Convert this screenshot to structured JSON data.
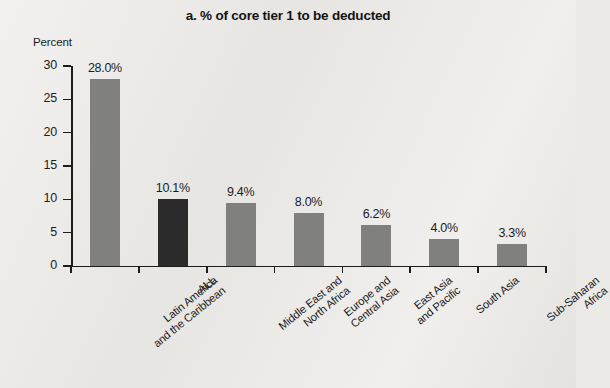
{
  "chart_data": {
    "type": "bar",
    "title": "a.  % of core tier 1 to be deducted",
    "xlabel": "",
    "ylabel": "Percent",
    "ylim": [
      0,
      30
    ],
    "yticks": [
      0,
      5,
      10,
      15,
      20,
      25,
      30
    ],
    "ytick_labels": [
      "0",
      "5",
      "10",
      "15",
      "20",
      "25",
      "30"
    ],
    "grid": false,
    "legend": "none",
    "categories": [
      "Latin America and the Caribbean",
      "ALL",
      "Middle East and North Africa",
      "Europe and Central Asia",
      "East Asia and Pacific",
      "South Asia",
      "Sub-Saharan Africa"
    ],
    "category_lines": [
      [
        "Latin America",
        "and the Caribbean"
      ],
      [
        "ALL"
      ],
      [
        "Middle East and",
        "North Africa"
      ],
      [
        "Europe and",
        "Central Asia"
      ],
      [
        "East Asia",
        "and Pacific"
      ],
      [
        "South Asia"
      ],
      [
        "Sub-Saharan",
        "Africa"
      ]
    ],
    "values": [
      28.0,
      10.1,
      9.4,
      8.0,
      6.2,
      4.0,
      3.3
    ],
    "value_labels": [
      "28.0%",
      "10.1%",
      "9.4%",
      "8.0%",
      "6.2%",
      "4.0%",
      "3.3%"
    ],
    "bar_colors": [
      "#80807f",
      "#2b2b2b",
      "#80807f",
      "#80807f",
      "#80807f",
      "#80807f",
      "#80807f"
    ],
    "colors": {
      "regional_bar": "#80807f",
      "all_bar": "#2b2b2b",
      "axis": "#1c1c1c",
      "background": "#eceae7",
      "text": "#1c1c1c"
    }
  }
}
